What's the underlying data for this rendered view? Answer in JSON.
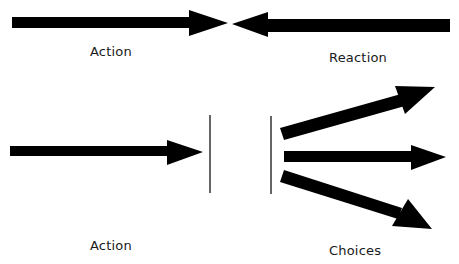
{
  "diagram": {
    "top_section": {
      "left_label": "Action",
      "right_label": "Reaction"
    },
    "bottom_section": {
      "left_label": "Action",
      "right_label": "Choices"
    },
    "colors": {
      "arrow": "#000000",
      "divider": "#333333",
      "background": "#ffffff",
      "text": "#1a1a1a"
    }
  }
}
